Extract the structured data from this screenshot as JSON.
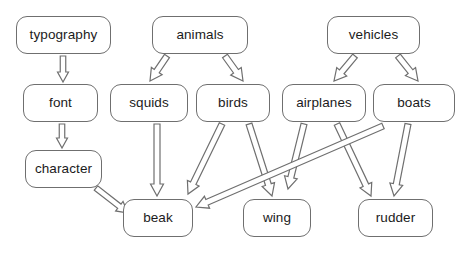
{
  "diagram": {
    "type": "concept-hierarchy-flow-diagram",
    "background_color": "#ffffff",
    "node_border_color": "#6f6f6f",
    "node_fill_color": "#ffffff",
    "arrow_fill_color": "#ffffff",
    "arrow_outline_color": "#6f6f6f",
    "text_color": "#1b1b1b",
    "nodes": [
      {
        "id": "typography",
        "label": "typography",
        "x": 16,
        "y": 16,
        "w": 95,
        "h": 38,
        "row": 1
      },
      {
        "id": "animals",
        "label": "animals",
        "x": 152,
        "y": 16,
        "w": 96,
        "h": 38,
        "row": 1
      },
      {
        "id": "vehicles",
        "label": "vehicles",
        "x": 327,
        "y": 16,
        "w": 93,
        "h": 38,
        "row": 1
      },
      {
        "id": "font",
        "label": "font",
        "x": 23,
        "y": 84,
        "w": 75,
        "h": 38,
        "row": 2
      },
      {
        "id": "squids",
        "label": "squids",
        "x": 110,
        "y": 84,
        "w": 78,
        "h": 38,
        "row": 2
      },
      {
        "id": "birds",
        "label": "birds",
        "x": 196,
        "y": 84,
        "w": 74,
        "h": 38,
        "row": 2
      },
      {
        "id": "airplanes",
        "label": "airplanes",
        "x": 282,
        "y": 84,
        "w": 84,
        "h": 38,
        "row": 2
      },
      {
        "id": "boats",
        "label": "boats",
        "x": 373,
        "y": 84,
        "w": 82,
        "h": 38,
        "row": 2
      },
      {
        "id": "character",
        "label": "character",
        "x": 25,
        "y": 150,
        "w": 77,
        "h": 38,
        "row": 3
      },
      {
        "id": "beak",
        "label": "beak",
        "x": 123,
        "y": 199,
        "w": 70,
        "h": 38,
        "row": 4
      },
      {
        "id": "wing",
        "label": "wing",
        "x": 243,
        "y": 199,
        "w": 68,
        "h": 38,
        "row": 4
      },
      {
        "id": "rudder",
        "label": "rudder",
        "x": 358,
        "y": 199,
        "w": 75,
        "h": 38,
        "row": 4
      }
    ],
    "edges": [
      {
        "id": "typography-font",
        "from": "typography",
        "to": "font",
        "x1": 63,
        "y1": 56,
        "x2": 63,
        "y2": 82,
        "shaft": 5.5,
        "head_w": 11,
        "head_l": 10
      },
      {
        "id": "font-character",
        "from": "font",
        "to": "character",
        "x1": 62,
        "y1": 124,
        "x2": 62,
        "y2": 148,
        "shaft": 5.5,
        "head_w": 11,
        "head_l": 10
      },
      {
        "id": "character-beak",
        "from": "character",
        "to": "beak",
        "x1": 96,
        "y1": 188,
        "x2": 128,
        "y2": 213,
        "shaft": 5.5,
        "head_w": 12,
        "head_l": 11
      },
      {
        "id": "animals-squids",
        "from": "animals",
        "to": "squids",
        "x1": 167,
        "y1": 56,
        "x2": 150,
        "y2": 81,
        "shaft": 6,
        "head_w": 13,
        "head_l": 12
      },
      {
        "id": "animals-birds",
        "from": "animals",
        "to": "birds",
        "x1": 225,
        "y1": 56,
        "x2": 243,
        "y2": 81,
        "shaft": 6,
        "head_w": 13,
        "head_l": 12
      },
      {
        "id": "vehicles-airplanes",
        "from": "vehicles",
        "to": "airplanes",
        "x1": 355,
        "y1": 56,
        "x2": 334,
        "y2": 81,
        "shaft": 6,
        "head_w": 13,
        "head_l": 12
      },
      {
        "id": "vehicles-boats",
        "from": "vehicles",
        "to": "boats",
        "x1": 398,
        "y1": 56,
        "x2": 418,
        "y2": 81,
        "shaft": 6,
        "head_w": 13,
        "head_l": 12
      },
      {
        "id": "squids-beak",
        "from": "squids",
        "to": "beak",
        "x1": 157,
        "y1": 124,
        "x2": 157,
        "y2": 196,
        "shaft": 6,
        "head_w": 13,
        "head_l": 12
      },
      {
        "id": "birds-beak",
        "from": "birds",
        "to": "beak",
        "x1": 222,
        "y1": 124,
        "x2": 188,
        "y2": 194,
        "shaft": 6,
        "head_w": 13,
        "head_l": 12
      },
      {
        "id": "birds-wing",
        "from": "birds",
        "to": "wing",
        "x1": 249,
        "y1": 124,
        "x2": 272,
        "y2": 196,
        "shaft": 6,
        "head_w": 13,
        "head_l": 12
      },
      {
        "id": "airplanes-wing",
        "from": "airplanes",
        "to": "wing",
        "x1": 304,
        "y1": 124,
        "x2": 288,
        "y2": 189,
        "shaft": 6,
        "head_w": 13,
        "head_l": 12
      },
      {
        "id": "airplanes-rudder",
        "from": "airplanes",
        "to": "rudder",
        "x1": 337,
        "y1": 124,
        "x2": 371,
        "y2": 196,
        "shaft": 6,
        "head_w": 13,
        "head_l": 12
      },
      {
        "id": "boats-beak",
        "from": "boats",
        "to": "beak",
        "x1": 383,
        "y1": 126,
        "x2": 196,
        "y2": 207,
        "shaft": 6,
        "head_w": 13,
        "head_l": 12
      },
      {
        "id": "boats-rudder",
        "from": "boats",
        "to": "rudder",
        "x1": 408,
        "y1": 124,
        "x2": 394,
        "y2": 196,
        "shaft": 6,
        "head_w": 13,
        "head_l": 12
      }
    ]
  }
}
